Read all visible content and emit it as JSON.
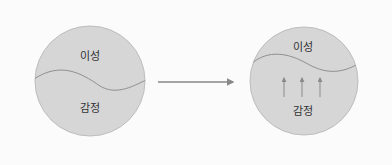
{
  "diagram": {
    "before": {
      "top_label": "이성",
      "bottom_label": "감정"
    },
    "after": {
      "top_label": "이성",
      "bottom_label": "감정",
      "arrow_count": 3
    },
    "transition_arrow": "right-arrow",
    "colors": {
      "circle_fill": "#d6d6d6",
      "circle_stroke": "#b8b8b8",
      "line": "#8a8a8a",
      "arrow": "#888888",
      "background": "#fbfbfb"
    }
  }
}
